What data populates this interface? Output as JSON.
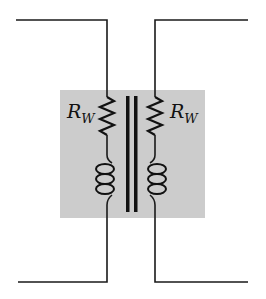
{
  "diagram": {
    "type": "transformer-equivalent-circuit",
    "shaded_region_color": "#cccccc",
    "line_color": "#111111",
    "components": [
      {
        "id": "primary-winding-resistance",
        "kind": "resistor",
        "side": "left",
        "label_main": "R",
        "label_sub": "W"
      },
      {
        "id": "secondary-winding-resistance",
        "kind": "resistor",
        "side": "right",
        "label_main": "R",
        "label_sub": "W"
      },
      {
        "id": "primary-coil",
        "kind": "inductor",
        "side": "left"
      },
      {
        "id": "secondary-coil",
        "kind": "inductor",
        "side": "right"
      },
      {
        "id": "iron-core",
        "kind": "core",
        "bars": 2
      }
    ]
  }
}
